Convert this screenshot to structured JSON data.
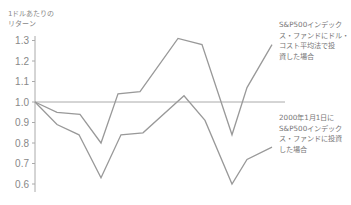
{
  "chart_data": {
    "type": "line",
    "title": "",
    "ylabel": "1ドルあたりの\nリターン",
    "xlabel": "",
    "ylim": [
      0.55,
      1.35
    ],
    "yticks": [
      1.3,
      1.2,
      1.1,
      1.0,
      0.9,
      0.8,
      0.7,
      0.6
    ],
    "ytick_labels": [
      "1.3",
      "1.2",
      "1.1",
      "1.0",
      "0.9",
      "0.8",
      "0.7",
      "0.6"
    ],
    "reference_line": 1.0,
    "grid": false,
    "x": [
      0,
      1,
      2,
      3,
      4,
      5,
      6,
      7,
      8,
      9,
      10
    ],
    "series": [
      {
        "name": "S&P500インデックス・ファンドにドル・コスト平均法で投資した場合",
        "values": [
          1.0,
          0.95,
          0.94,
          0.8,
          1.04,
          1.05,
          1.31,
          1.28,
          0.84,
          1.07,
          1.28
        ],
        "x_px": [
          35,
          57,
          80,
          101,
          118,
          140,
          178,
          202,
          232,
          247,
          272
        ]
      },
      {
        "name": "2000年1月1日にS&P500インデックス・ファンドに投資した場合",
        "values": [
          1.0,
          0.89,
          0.84,
          0.63,
          0.84,
          0.85,
          1.03,
          0.91,
          0.6,
          0.72,
          0.78
        ],
        "x_px": [
          35,
          57,
          79,
          101,
          121,
          143,
          184,
          205,
          232,
          247,
          272
        ]
      }
    ],
    "annotations": [
      "S&P500インデックス・ファンドにドル・コスト平均法で投資した場合",
      "2000年1月1日にS&P500インデックス・ファンドに投資した場合"
    ]
  },
  "labels": {
    "ylabel": "1ドルあたりの\nリターン",
    "note_top": "S&P500インデックス・ファンドにドル・コスト平均法で投資した場合",
    "note_top_lines": "S&P500インデック\nス・ファンドにドル・\nコスト平均法で投\n資した場合",
    "note_bottom_lines": "2000年1月1日に\nS&P500インデック\nス・ファンドに投資\nした場合"
  },
  "colors": {
    "line": "#999999",
    "axis": "#aaaaaa",
    "text": "#777777"
  }
}
